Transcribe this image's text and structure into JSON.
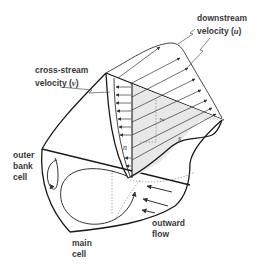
{
  "diagram": {
    "labels": {
      "downstream": {
        "line1": "downstream",
        "line2_prefix": "velocity (",
        "symbol": "u",
        "line2_suffix": ")"
      },
      "cross_stream": {
        "line1": "cross-stream",
        "line2_prefix": "velocity (",
        "symbol": "v",
        "line2_suffix": ")"
      },
      "outer_bank_cell": {
        "line1": "outer",
        "line2": "bank",
        "line3": "cell"
      },
      "main_cell": {
        "line1": "main",
        "line2": "cell"
      },
      "outward_flow": {
        "line1": "outward",
        "line2": "flow"
      }
    },
    "axes": {
      "z": "z",
      "n": "n",
      "s": "s"
    },
    "colors": {
      "outline": "#1a1a1a",
      "shade": "#e6e6e6",
      "arrow": "#333333",
      "dotted": "#888888",
      "text": "#3a3a3a"
    }
  }
}
